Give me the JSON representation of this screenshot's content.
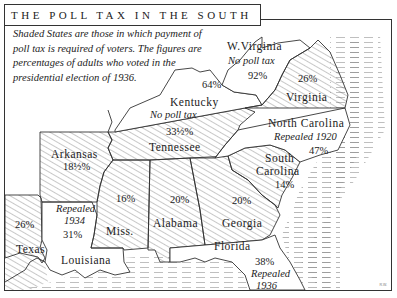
{
  "title": "THE POLL TAX IN THE SOUTH",
  "caption": "Shaded States are those in which payment of poll tax is required of voters. The figures are percentages of adults who voted in the presidential election of 1936.",
  "legend": {
    "shaded": "poll tax required",
    "unshaded": "no poll tax / repealed"
  },
  "states": [
    {
      "name": "W. Virginia",
      "note": "No poll tax",
      "percent": "92%",
      "shaded": false
    },
    {
      "name": "Kentucky",
      "note": "No poll tax",
      "percent": "64%",
      "shaded": false
    },
    {
      "name": "Virginia",
      "note": "",
      "percent": "26%",
      "shaded": true
    },
    {
      "name": "North Carolina",
      "note": "Repealed 1920",
      "percent": "47%",
      "shaded": false
    },
    {
      "name": "Tennessee",
      "note": "",
      "percent": "33½%",
      "shaded": true
    },
    {
      "name": "Arkansas",
      "note": "",
      "percent": "18½%",
      "shaded": true
    },
    {
      "name": "South Carolina",
      "note": "",
      "percent": "14%",
      "shaded": true
    },
    {
      "name": "Miss.",
      "note": "",
      "percent": "16%",
      "shaded": true
    },
    {
      "name": "Alabama",
      "note": "",
      "percent": "20%",
      "shaded": true
    },
    {
      "name": "Georgia",
      "note": "",
      "percent": "20%",
      "shaded": true
    },
    {
      "name": "Texas",
      "note": "",
      "percent": "26%",
      "shaded": true
    },
    {
      "name": "Louisiana",
      "note": "Repealed 1934",
      "percent": "31%",
      "shaded": false
    },
    {
      "name": "Florida",
      "note": "Repealed 1936",
      "percent": "38%",
      "shaded": false
    }
  ],
  "labels": {
    "wv_name": "W.Virginia",
    "wv_note": "No poll tax",
    "wv_pct": "92%",
    "ky_name": "Kentucky",
    "ky_note": "No poll tax",
    "ky_pct": "64%",
    "va_name": "Virginia",
    "va_pct": "26%",
    "nc_name": "North Carolina",
    "nc_note": "Repealed 1920",
    "nc_pct": "47%",
    "tn_name": "Tennessee",
    "tn_pct": "33½%",
    "ar_name": "Arkansas",
    "ar_pct": "18½%",
    "sc_name1": "South",
    "sc_name2": "Carolina",
    "sc_pct": "14%",
    "ms_name": "Miss.",
    "ms_pct": "16%",
    "al_name": "Alabama",
    "al_pct": "20%",
    "ga_name": "Georgia",
    "ga_pct": "20%",
    "tx_name": "Texas",
    "tx_pct": "26%",
    "la_note1": "Repealed",
    "la_note2": "1934",
    "la_pct": "31%",
    "la_name": "Louisiana",
    "fl_name": "Florida",
    "fl_pct": "38%",
    "fl_note1": "Repealed",
    "fl_note2": "1936"
  },
  "credit": "R.W."
}
